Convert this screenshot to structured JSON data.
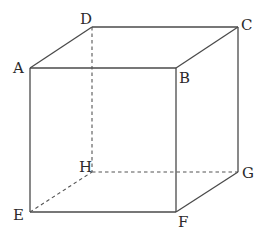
{
  "diagram": {
    "type": "cube",
    "colors": {
      "edge": "#4a4a4a",
      "hidden_edge": "#555555",
      "label": "#2a2a2a",
      "background": "#ffffff"
    },
    "vertices": {
      "A": {
        "label": "A",
        "x": 30,
        "y": 68
      },
      "B": {
        "label": "B",
        "x": 176,
        "y": 68
      },
      "C": {
        "label": "C",
        "x": 238,
        "y": 27
      },
      "D": {
        "label": "D",
        "x": 92,
        "y": 27
      },
      "E": {
        "label": "E",
        "x": 30,
        "y": 212
      },
      "F": {
        "label": "F",
        "x": 176,
        "y": 212
      },
      "G": {
        "label": "G",
        "x": 238,
        "y": 172
      },
      "H": {
        "label": "H",
        "x": 92,
        "y": 172
      }
    },
    "visible_edges": [
      "AB",
      "BC",
      "CD",
      "DA",
      "AE",
      "BF",
      "CG",
      "EF",
      "FG"
    ],
    "hidden_edges": [
      "DH",
      "EH",
      "HG"
    ]
  }
}
